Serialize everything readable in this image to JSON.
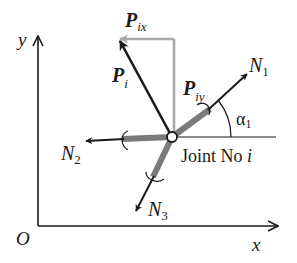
{
  "diagram": {
    "axes": {
      "x_label": "x",
      "y_label": "y",
      "origin_label": "O"
    },
    "joint": {
      "label_text": "Joint No ",
      "label_index": "i"
    },
    "load": {
      "resultant": {
        "symbol": "P",
        "subscript": "i"
      },
      "x_component": {
        "symbol": "P",
        "subscript": "ix"
      },
      "y_component": {
        "symbol": "P",
        "subscript": "iy"
      }
    },
    "members": [
      {
        "symbol": "N",
        "subscript": "1"
      },
      {
        "symbol": "N",
        "subscript": "2"
      },
      {
        "symbol": "N",
        "subscript": "3"
      }
    ],
    "angle": {
      "symbol": "α",
      "subscript": "1"
    },
    "colors": {
      "ink": "#1a1a1a",
      "component_gray": "#a8a8a8",
      "member_gray": "#7a7a7a"
    }
  }
}
